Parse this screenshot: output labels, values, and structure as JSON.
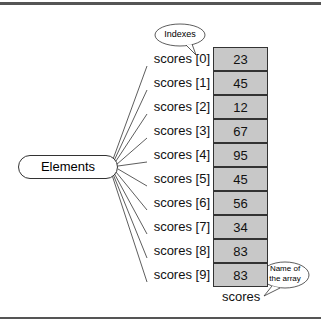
{
  "diagram": {
    "elements_label": "Elements",
    "indexes_callout": "Indexes",
    "name_callout_line1": "Name of",
    "name_callout_line2": "the array",
    "array_name": "scores",
    "rows": [
      {
        "index_label": "scores [0]",
        "value": "23"
      },
      {
        "index_label": "scores [1]",
        "value": "45"
      },
      {
        "index_label": "scores [2]",
        "value": "12"
      },
      {
        "index_label": "scores [3]",
        "value": "67"
      },
      {
        "index_label": "scores [4]",
        "value": "95"
      },
      {
        "index_label": "scores [5]",
        "value": "45"
      },
      {
        "index_label": "scores [6]",
        "value": "56"
      },
      {
        "index_label": "scores [7]",
        "value": "34"
      },
      {
        "index_label": "scores [8]",
        "value": "83"
      },
      {
        "index_label": "scores [9]",
        "value": "83"
      }
    ],
    "colors": {
      "cell_fill": "#c8c8c8",
      "border": "#333333",
      "rule": "#555555"
    }
  }
}
